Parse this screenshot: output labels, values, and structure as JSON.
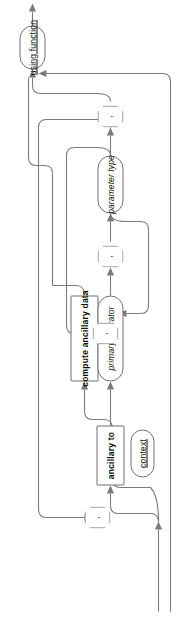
{
  "diagram": {
    "type": "railroad-syntax-diagram",
    "orientation": "rotated-90-ccw",
    "direction": "bottom-to-top",
    "stroke_color": "#7a7a7a",
    "text_color": "#111111",
    "background": "#ffffff",
    "nodes": [
      {
        "id": "using-function",
        "label": "using function",
        "kind": "terminal"
      },
      {
        "id": "comma-1",
        "label": ",",
        "kind": "separator"
      },
      {
        "id": "parameter-type",
        "label": "parameter type",
        "kind": "nonterminal"
      },
      {
        "id": "comma-2",
        "label": ",",
        "kind": "separator"
      },
      {
        "id": "comma-3",
        "label": ",",
        "kind": "separator"
      },
      {
        "id": "comma-4",
        "label": ",",
        "kind": "separator"
      },
      {
        "id": "primary-operator",
        "label": "primary operator",
        "kind": "nonterminal"
      },
      {
        "id": "compute-ancillary-data",
        "label": "compute ancillary data",
        "kind": "keyword"
      },
      {
        "id": "ancillary-to",
        "label": "ancillary to",
        "kind": "keyword"
      },
      {
        "id": "context",
        "label": "context",
        "kind": "terminal"
      }
    ]
  }
}
